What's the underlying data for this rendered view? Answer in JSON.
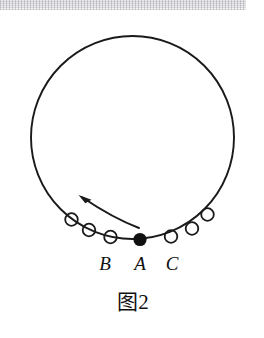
{
  "figure": {
    "caption": "图2",
    "caption_x": 133,
    "caption_y": 308,
    "background_color": "#ffffff",
    "ink_color": "#1a1a1a"
  },
  "scan_artifact": {
    "present": true,
    "x": 0,
    "y": 0,
    "width": 246,
    "height": 10,
    "color": "#dcdce0"
  },
  "track": {
    "shape": "circle",
    "description": "large circular loop (vertical circle track)",
    "cx": 132.5,
    "cy": 137.5,
    "r": 101.5,
    "stroke_width": 1.9,
    "color": "#1a1a1a"
  },
  "ball": {
    "label": "A",
    "filled": true,
    "cx": 140.0,
    "cy": 239.5,
    "r": 6.6,
    "color": "#111111"
  },
  "positions": [
    {
      "label": "B",
      "type": "open-circle",
      "cx": 71.5,
      "cy": 219.5,
      "r": 6.3,
      "label_x": 105,
      "label_y": 270
    },
    {
      "label": "A",
      "type": "filled-ball",
      "cx": 140.0,
      "cy": 239.5,
      "r": 6.6,
      "label_x": 140,
      "label_y": 270
    },
    {
      "label": "C",
      "type": "open-circle",
      "cx": 171.0,
      "cy": 236.5,
      "r": 6.3,
      "label_x": 172,
      "label_y": 270
    }
  ],
  "ball_trace_left": [
    {
      "cx": 71.5,
      "cy": 219.5,
      "r": 6.3
    },
    {
      "cx": 89.0,
      "cy": 230.0,
      "r": 6.3
    },
    {
      "cx": 110.5,
      "cy": 237.0,
      "r": 6.3
    }
  ],
  "ball_trace_right": [
    {
      "cx": 171.0,
      "cy": 236.5,
      "r": 6.3
    },
    {
      "cx": 192.0,
      "cy": 228.5,
      "r": 6.3
    },
    {
      "cx": 207.5,
      "cy": 214.5,
      "r": 6.3
    }
  ],
  "motion_arrow": {
    "meaning": "direction of motion along the track, leftward and upward",
    "path": "M 139 228 C 118 220, 98 208, 82.5 197.5",
    "stroke_width": 2.0,
    "head": "M 79 195.5 L 90.5 199.0 L 85.0 202.0 Z",
    "tip_x": 79,
    "tip_y": 195.5,
    "color": "#1a1a1a"
  },
  "labels": {
    "b": "B",
    "a": "A",
    "c": "C"
  }
}
